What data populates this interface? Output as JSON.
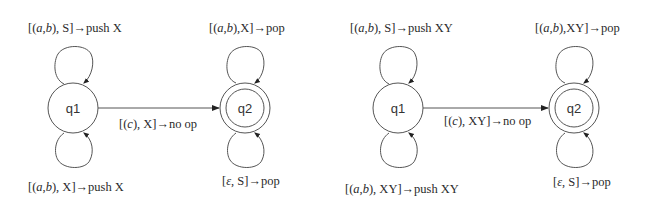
{
  "diagrams": [
    {
      "states": [
        {
          "id": "q1",
          "label": "q1",
          "accepting": false
        },
        {
          "id": "q2",
          "label": "q2",
          "accepting": true
        }
      ],
      "transitions": {
        "q1_top_loop": "[(a,b), S]→push X",
        "q1_bottom_loop": "[(a,b), X]→push X",
        "q1_to_q2": "[(c), X]→no op",
        "q2_top_loop": "[(a,b),X]→pop",
        "q2_bottom_loop": "[ε, S]→pop"
      },
      "parts": {
        "q1_top": {
          "pre": "[(",
          "a": "a",
          "comma": ",",
          "b": "b",
          "post": "), S]→push X"
        },
        "q1_bottom": {
          "pre": "[(",
          "a": "a",
          "comma": ",",
          "b": "b",
          "post": "), X]→push X"
        },
        "edge": {
          "pre": "[(",
          "c": "c",
          "post": "), X]→no op"
        },
        "q2_top": {
          "pre": "[(",
          "a": "a",
          "comma": ",",
          "b": "b",
          "post": "),X]→pop"
        },
        "q2_bottom": {
          "pre": "[",
          "eps": "ε",
          "post": ", S]→pop"
        }
      }
    },
    {
      "states": [
        {
          "id": "q1",
          "label": "q1",
          "accepting": false
        },
        {
          "id": "q2",
          "label": "q2",
          "accepting": true
        }
      ],
      "transitions": {
        "q1_top_loop": "[(a,b), S]→push XY",
        "q1_bottom_loop": "[(a,b), XY]→push XY",
        "q1_to_q2": "[(c), XY]→no op",
        "q2_top_loop": "[(a,b),XY]→pop",
        "q2_bottom_loop": "[ε, S]→pop"
      },
      "parts": {
        "q1_top": {
          "pre": "[(",
          "a": "a",
          "comma": ",",
          "b": "b",
          "post": "), S]→push XY"
        },
        "q1_bottom": {
          "pre": "[(",
          "a": "a",
          "comma": ",",
          "b": "b",
          "post": "), XY]→push XY"
        },
        "edge": {
          "pre": "[(",
          "c": "c",
          "post": "), XY]→no op"
        },
        "q2_top": {
          "pre": "[(",
          "a": "a",
          "comma": ",",
          "b": "b",
          "post": "),XY]→pop"
        },
        "q2_bottom": {
          "pre": "[",
          "eps": "ε",
          "post": ", S]→pop"
        }
      }
    }
  ]
}
